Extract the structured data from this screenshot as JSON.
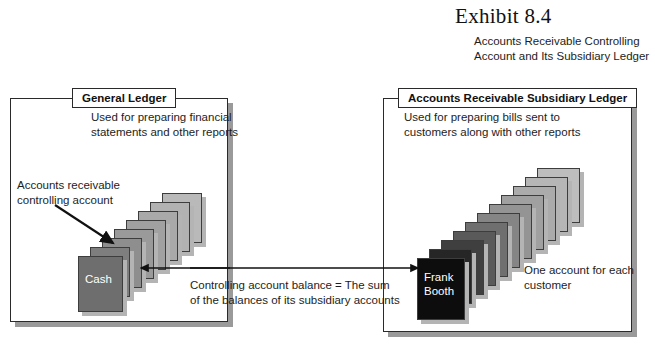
{
  "exhibit": {
    "title": "Exhibit 8.4",
    "subtitle": "Accounts Receivable Controlling Account and Its Subsidiary Ledger"
  },
  "left_panel": {
    "tab_label": "General Ledger",
    "description": "Used for preparing financial statements and other reports",
    "annotation": "Accounts receivable controlling account",
    "front_card_label": "Cash",
    "card_count": 8,
    "card_colors": [
      "#b9b9b9",
      "#b2b2b2",
      "#a9a9a9",
      "#a1a1a1",
      "#9a9a9a",
      "#8e8e8e",
      "#7e7e7e",
      "#6e6e6e"
    ]
  },
  "right_panel": {
    "tab_label": "Accounts Receivable Subsidiary Ledger",
    "description": "Used for preparing bills sent to customers along with other reports",
    "annotation": "One account for each customer",
    "front_card_label": "Frank Booth",
    "front_card_label_line1": "Frank",
    "front_card_label_line2": "Booth",
    "card_count": 11,
    "card_colors": [
      "#bdbdbd",
      "#b6b6b6",
      "#ababab",
      "#a0a0a0",
      "#949494",
      "#858585",
      "#6f6f6f",
      "#5a5a5a",
      "#3f3f3f",
      "#262626",
      "#0d0d0d"
    ]
  },
  "center": {
    "caption_line1": "Controlling account balance = The sum",
    "caption_line2": "of the balances of its subsidiary accounts"
  },
  "colors": {
    "background": "#ffffff",
    "border": "#2a2a2a",
    "text": "#1d1d1d",
    "shadow": "#9a9a9a"
  }
}
